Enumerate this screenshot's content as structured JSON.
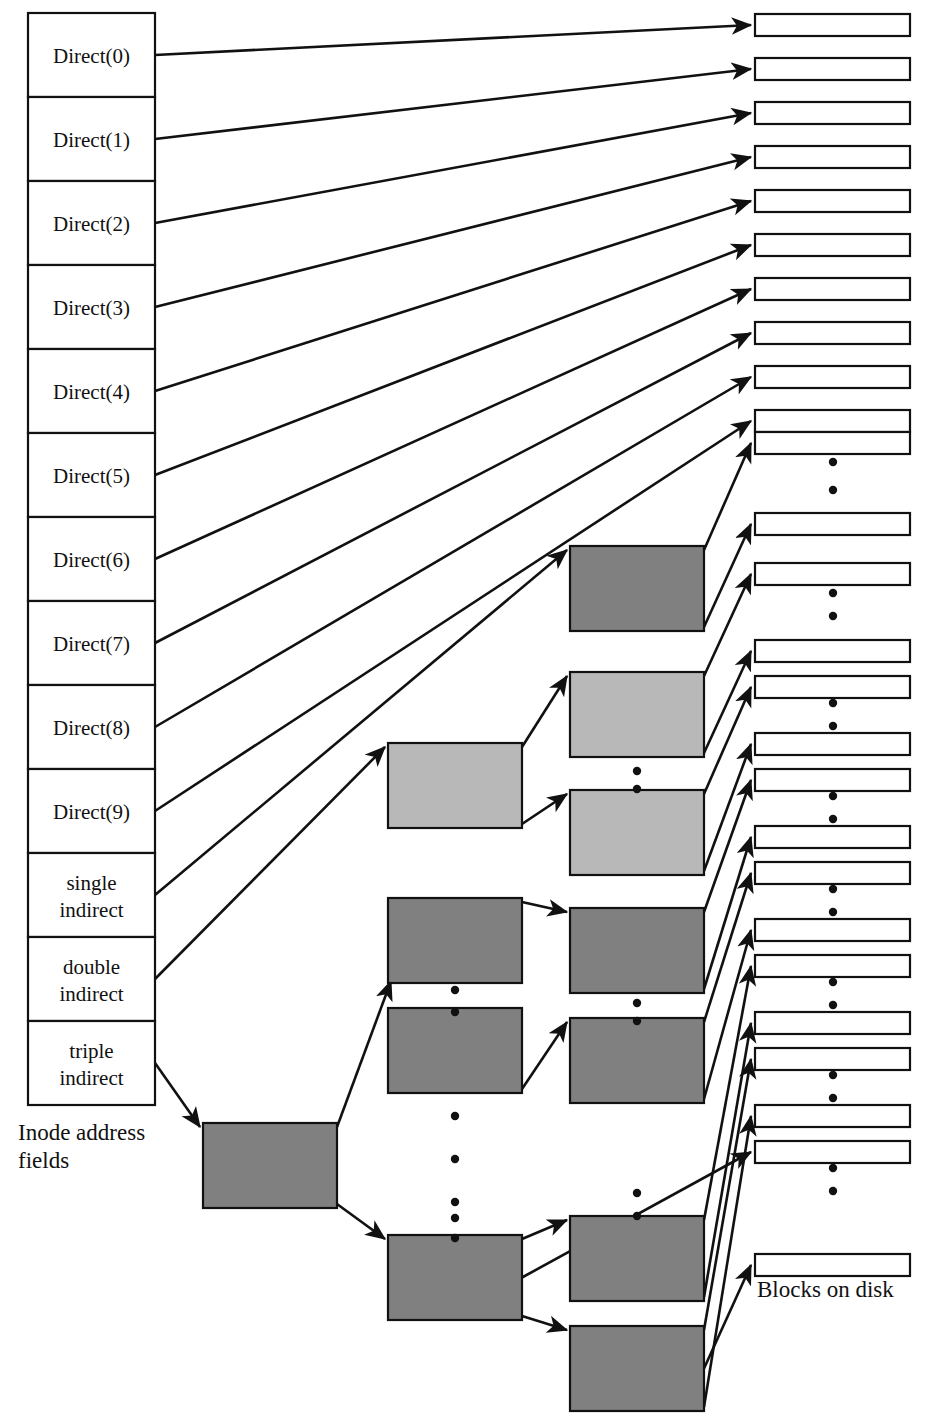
{
  "figure": {
    "inode_caption": "Inode address fields",
    "disk_caption": "Blocks on disk"
  },
  "colors": {
    "background": "#ffffff",
    "line": "#111111",
    "block_white": "#ffffff",
    "indirect_dark_gray": "#808080",
    "indirect_light_gray": "#b8b8b8"
  },
  "inode": {
    "x": 28,
    "y": 13,
    "width": 127,
    "row_height": 84,
    "rows": 13,
    "fields": [
      {
        "label": "Direct(0)",
        "kind": "direct",
        "lines": [
          "Direct(0)"
        ]
      },
      {
        "label": "Direct(1)",
        "kind": "direct",
        "lines": [
          "Direct(1)"
        ]
      },
      {
        "label": "Direct(2)",
        "kind": "direct",
        "lines": [
          "Direct(2)"
        ]
      },
      {
        "label": "Direct(3)",
        "kind": "direct",
        "lines": [
          "Direct(3)"
        ]
      },
      {
        "label": "Direct(4)",
        "kind": "direct",
        "lines": [
          "Direct(4)"
        ]
      },
      {
        "label": "Direct(5)",
        "kind": "direct",
        "lines": [
          "Direct(5)"
        ]
      },
      {
        "label": "Direct(6)",
        "kind": "direct",
        "lines": [
          "Direct(6)"
        ]
      },
      {
        "label": "Direct(7)",
        "kind": "direct",
        "lines": [
          "Direct(7)"
        ]
      },
      {
        "label": "Direct(8)",
        "kind": "direct",
        "lines": [
          "Direct(8)"
        ]
      },
      {
        "label": "Direct(9)",
        "kind": "direct",
        "lines": [
          "Direct(9)"
        ]
      },
      {
        "label": "single indirect",
        "kind": "single-indirect",
        "lines": [
          "single",
          "indirect"
        ]
      },
      {
        "label": "double indirect",
        "kind": "double-indirect",
        "lines": [
          "double",
          "indirect"
        ]
      },
      {
        "label": "triple indirect",
        "kind": "triple-indirect",
        "lines": [
          "triple",
          "indirect"
        ]
      }
    ]
  },
  "indirect_blocks": {
    "width": 134,
    "height": 85,
    "level1": [
      {
        "name": "single-indirect-block",
        "x": 570,
        "y": 546,
        "shade": "dark"
      },
      {
        "name": "double-indirect-block",
        "x": 388,
        "y": 743,
        "shade": "light"
      },
      {
        "name": "triple-indirect-block",
        "x": 203,
        "y": 1123,
        "shade": "dark"
      }
    ],
    "level2": [
      {
        "name": "double-indirect-child-1",
        "x": 570,
        "y": 672,
        "shade": "light"
      },
      {
        "name": "double-indirect-child-2",
        "x": 570,
        "y": 790,
        "shade": "light"
      },
      {
        "name": "triple-indirect-child-1",
        "x": 388,
        "y": 898,
        "shade": "dark"
      },
      {
        "name": "triple-indirect-child-2",
        "x": 388,
        "y": 1008,
        "shade": "dark"
      },
      {
        "name": "triple-indirect-child-3",
        "x": 388,
        "y": 1235,
        "shade": "dark"
      }
    ],
    "level3": [
      {
        "name": "triple-leaf-block-1",
        "x": 570,
        "y": 908,
        "shade": "dark"
      },
      {
        "name": "triple-leaf-block-2",
        "x": 570,
        "y": 1018,
        "shade": "dark"
      },
      {
        "name": "triple-leaf-block-3",
        "x": 570,
        "y": 1216,
        "shade": "dark"
      },
      {
        "name": "triple-leaf-block-4",
        "x": 570,
        "y": 1326,
        "shade": "dark"
      }
    ]
  },
  "disk_blocks": {
    "x": 755,
    "width": 155,
    "height": 22,
    "direct_ys": [
      14,
      58,
      102,
      146,
      190,
      234,
      278,
      322,
      366,
      410,
      432
    ],
    "indirect_ys": [
      513,
      563,
      640,
      676,
      733,
      769,
      826,
      862,
      919,
      955,
      1012,
      1048,
      1105,
      1141,
      1254
    ],
    "count": 26
  },
  "dot_groups": [
    {
      "name": "disk-dots-1",
      "x": 833,
      "ys": [
        462,
        490
      ]
    },
    {
      "name": "disk-dots-2",
      "x": 833,
      "ys": [
        593,
        616
      ]
    },
    {
      "name": "disk-dots-3",
      "x": 833,
      "ys": [
        703,
        726
      ]
    },
    {
      "name": "disk-dots-4",
      "x": 833,
      "ys": [
        796,
        819
      ]
    },
    {
      "name": "disk-dots-5",
      "x": 833,
      "ys": [
        889,
        912
      ]
    },
    {
      "name": "disk-dots-6",
      "x": 833,
      "ys": [
        982,
        1005
      ]
    },
    {
      "name": "disk-dots-7",
      "x": 833,
      "ys": [
        1075,
        1098
      ]
    },
    {
      "name": "disk-dots-8",
      "x": 833,
      "ys": [
        1168,
        1191
      ]
    },
    {
      "name": "indirect-dots-1",
      "x": 637,
      "ys": [
        771,
        789
      ]
    },
    {
      "name": "indirect-dots-2",
      "x": 637,
      "ys": [
        1003,
        1021
      ]
    },
    {
      "name": "indirect-dots-3",
      "x": 637,
      "ys": [
        1193,
        1216
      ]
    },
    {
      "name": "indirect-dots-4",
      "x": 455,
      "ys": [
        990,
        1012
      ]
    },
    {
      "name": "indirect-dots-5",
      "x": 455,
      "ys": [
        1218,
        1238
      ]
    },
    {
      "name": "root-dots",
      "x": 455,
      "ys": [
        1116,
        1159,
        1202
      ]
    }
  ]
}
